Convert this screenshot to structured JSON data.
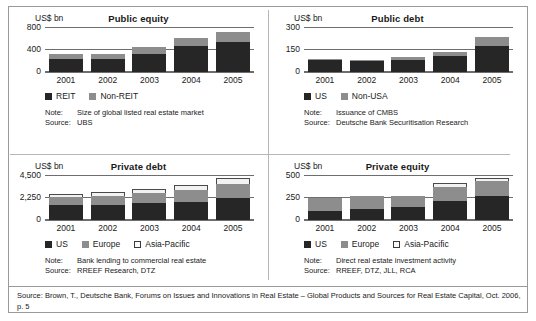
{
  "figure": {
    "source_line": "Source: Brown, T., Deutsche Bank, Forums on Issues and Innovations in Real Estate – Global Products and Sources for Real Estate Capital, Oct. 2006, p. 5"
  },
  "colors": {
    "dark": "#262626",
    "grey": "#8d8d8d",
    "white": "#f2f2f2",
    "axis": "#6e6e6e",
    "frame": "#9a9a9a"
  },
  "panels": [
    {
      "id": "public-equity",
      "unit": "US$ bn",
      "title": "Public equity",
      "note_key": "Note:",
      "note_value": "Size of global listed real estate market",
      "source_key": "Source:",
      "source_value": "UBS"
    },
    {
      "id": "public-debt",
      "unit": "US$ bn",
      "title": "Public debt",
      "note_key": "Note:",
      "note_value": "Issuance of CMBS",
      "source_key": "Source:",
      "source_value": "Deutsche Bank Securitisation Research"
    },
    {
      "id": "private-debt",
      "unit": "US$ bn",
      "title": "Private debt",
      "note_key": "Note:",
      "note_value": "Bank lending to commercial real estate",
      "source_key": "Source:",
      "source_value": "RREEF Research, DTZ"
    },
    {
      "id": "private-equity",
      "unit": "US$ bn",
      "title": "Private equity",
      "note_key": "Note:",
      "note_value": "Direct real estate investment activity",
      "source_key": "Source:",
      "source_value": "RREEF, DTZ, JLL, RCA"
    }
  ],
  "chart_data": [
    {
      "id": "public-equity",
      "type": "bar",
      "stacked": true,
      "title": "Public equity",
      "xlabel": "",
      "ylabel": "US$ bn",
      "categories": [
        "2001",
        "2002",
        "2003",
        "2004",
        "2005"
      ],
      "yticks": [
        0,
        400,
        800
      ],
      "ytick_labels": [
        "0",
        "400",
        "800"
      ],
      "ylim": [
        0,
        880
      ],
      "grid": true,
      "legend_position": "below-axis-left",
      "series": [
        {
          "name": "REIT",
          "color": "#262626",
          "values": [
            235,
            240,
            330,
            470,
            545
          ]
        },
        {
          "name": "Non-REIT",
          "color": "#8d8d8d",
          "values": [
            90,
            95,
            130,
            145,
            185
          ]
        }
      ],
      "totals": [
        325,
        335,
        460,
        615,
        730
      ]
    },
    {
      "id": "public-debt",
      "type": "bar",
      "stacked": true,
      "title": "Public debt",
      "xlabel": "",
      "ylabel": "US$ bn",
      "categories": [
        "2001",
        "2002",
        "2003",
        "2004",
        "2005"
      ],
      "yticks": [
        0,
        150,
        300
      ],
      "ytick_labels": [
        "0",
        "150",
        "300"
      ],
      "ylim": [
        0,
        330
      ],
      "grid": true,
      "legend_position": "below-axis-left",
      "series": [
        {
          "name": "US",
          "color": "#262626",
          "values": [
            80,
            73,
            85,
            110,
            180
          ]
        },
        {
          "name": "Non-USA",
          "color": "#8d8d8d",
          "values": [
            12,
            10,
            15,
            28,
            62
          ]
        }
      ],
      "totals": [
        92,
        83,
        100,
        138,
        242
      ]
    },
    {
      "id": "private-debt",
      "type": "bar",
      "stacked": true,
      "title": "Private debt",
      "xlabel": "",
      "ylabel": "US$ bn",
      "categories": [
        "2001",
        "2002",
        "2003",
        "2004",
        "2005"
      ],
      "yticks": [
        0,
        2250,
        4500
      ],
      "ytick_labels": [
        "0",
        "2,250",
        "4,500"
      ],
      "ylim": [
        0,
        4950
      ],
      "grid": true,
      "legend_position": "below-axis-left",
      "series": [
        {
          "name": "US",
          "color": "#262626",
          "values": [
            1530,
            1600,
            1760,
            1900,
            2280
          ]
        },
        {
          "name": "Europe",
          "color": "#8d8d8d",
          "values": [
            830,
            880,
            1010,
            1240,
            1440
          ]
        },
        {
          "name": "Asia-Pacific",
          "color": "#f2f2f2",
          "values": [
            370,
            410,
            420,
            440,
            620
          ]
        }
      ],
      "totals": [
        2730,
        2890,
        3190,
        3580,
        4340
      ]
    },
    {
      "id": "private-equity",
      "type": "bar",
      "stacked": true,
      "title": "Private equity",
      "xlabel": "",
      "ylabel": "US$ bn",
      "categories": [
        "2001",
        "2002",
        "2003",
        "2004",
        "2005"
      ],
      "yticks": [
        0,
        250,
        500
      ],
      "ytick_labels": [
        "0",
        "250",
        "500"
      ],
      "ylim": [
        0,
        550
      ],
      "grid": true,
      "legend_position": "below-axis-left",
      "series": [
        {
          "name": "US",
          "color": "#262626",
          "values": [
            100,
            128,
            150,
            215,
            275
          ]
        },
        {
          "name": "Europe",
          "color": "#8d8d8d",
          "values": [
            155,
            145,
            125,
            160,
            175
          ]
        },
        {
          "name": "Asia-Pacific",
          "color": "#f2f2f2",
          "values": [
            0,
            0,
            0,
            45,
            35
          ]
        }
      ],
      "totals": [
        255,
        273,
        275,
        420,
        485
      ]
    }
  ]
}
